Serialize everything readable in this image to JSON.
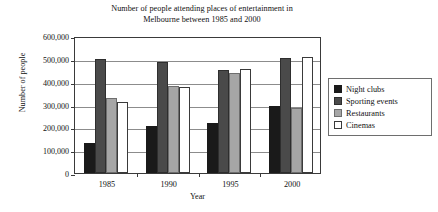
{
  "chart_data": {
    "type": "bar",
    "title": "Number of people attending places of entertainment in Melbourne between 1985 and 2000",
    "title_lines": [
      "Number of people attending places of entertainment in",
      "Melbourne between 1985 and 2000"
    ],
    "xlabel": "Year",
    "ylabel": "Number of people",
    "categories": [
      "1985",
      "1990",
      "1995",
      "2000"
    ],
    "ylim": [
      0,
      600000
    ],
    "ytick_step": 100000,
    "ytick_labels": [
      "0",
      "100,000",
      "200,000",
      "300,000",
      "400,000",
      "500,000",
      "600,000"
    ],
    "ytick_values": [
      0,
      100000,
      200000,
      300000,
      400000,
      500000,
      600000
    ],
    "grid": true,
    "legend_position": "right",
    "series": [
      {
        "name": "Night clubs",
        "color": "#1a1a1a",
        "values": [
          130000,
          205000,
          220000,
          295000
        ]
      },
      {
        "name": "Sporting events",
        "color": "#4a4a4a",
        "values": [
          500000,
          485000,
          450000,
          505000
        ]
      },
      {
        "name": "Restaurants",
        "color": "#a6a6a6",
        "values": [
          330000,
          380000,
          440000,
          285000
        ]
      },
      {
        "name": "Cinemas",
        "color": "#ffffff",
        "values": [
          310000,
          375000,
          455000,
          510000
        ]
      }
    ]
  }
}
